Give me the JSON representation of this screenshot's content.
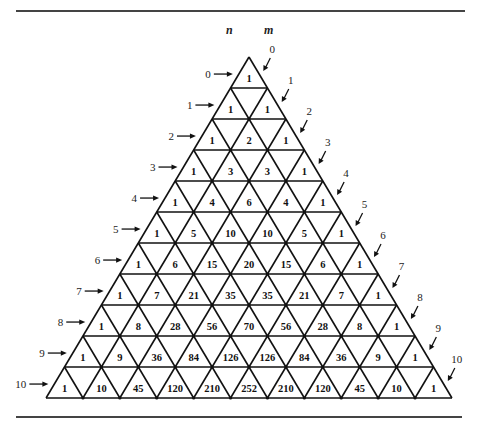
{
  "figure": {
    "header_labels": {
      "n": "n",
      "m": "m"
    },
    "row_labels_n": [
      "0",
      "1",
      "2",
      "3",
      "4",
      "5",
      "6",
      "7",
      "8",
      "9",
      "10"
    ],
    "diagonal_labels_m": [
      "0",
      "1",
      "2",
      "3",
      "4",
      "5",
      "6",
      "7",
      "8",
      "9",
      "10"
    ],
    "rows": [
      [
        1
      ],
      [
        1,
        1
      ],
      [
        1,
        2,
        1
      ],
      [
        1,
        3,
        3,
        1
      ],
      [
        1,
        4,
        6,
        4,
        1
      ],
      [
        1,
        5,
        10,
        10,
        5,
        1
      ],
      [
        1,
        6,
        15,
        20,
        15,
        6,
        1
      ],
      [
        1,
        7,
        21,
        35,
        35,
        21,
        7,
        1
      ],
      [
        1,
        8,
        28,
        56,
        70,
        56,
        28,
        8,
        1
      ],
      [
        1,
        9,
        36,
        84,
        126,
        126,
        84,
        36,
        9,
        1
      ],
      [
        1,
        10,
        45,
        120,
        210,
        252,
        210,
        120,
        45,
        10,
        1
      ]
    ],
    "colors": {
      "line": "#111111",
      "rule": "#444444",
      "background": "#ffffff"
    }
  },
  "chart_data": {
    "type": "table",
    "xlabel": "m",
    "ylabel": "n",
    "rows": [
      [
        1
      ],
      [
        1,
        1
      ],
      [
        1,
        2,
        1
      ],
      [
        1,
        3,
        3,
        1
      ],
      [
        1,
        4,
        6,
        4,
        1
      ],
      [
        1,
        5,
        10,
        10,
        5,
        1
      ],
      [
        1,
        6,
        15,
        20,
        15,
        6,
        1
      ],
      [
        1,
        7,
        21,
        35,
        35,
        21,
        7,
        1
      ],
      [
        1,
        8,
        28,
        56,
        70,
        56,
        28,
        8,
        1
      ],
      [
        1,
        9,
        36,
        84,
        126,
        126,
        84,
        36,
        9,
        1
      ],
      [
        1,
        10,
        45,
        120,
        210,
        252,
        210,
        120,
        45,
        10,
        1
      ]
    ]
  }
}
